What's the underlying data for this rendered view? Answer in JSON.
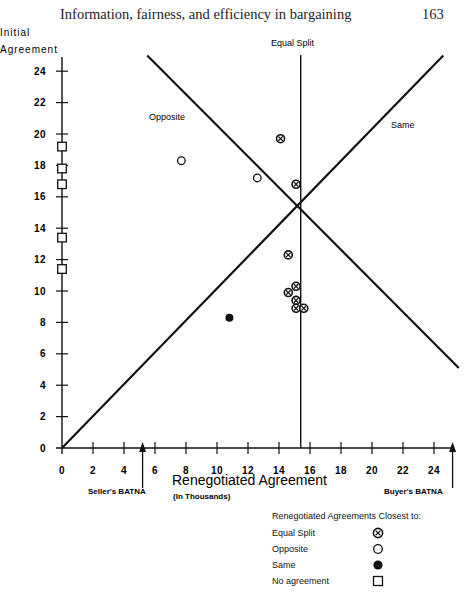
{
  "header": {
    "title": "Information, fairness, and efficiency in bargaining",
    "page_number": "163"
  },
  "chart_data": {
    "type": "scatter",
    "title": "",
    "ylabel_line1": "Initial",
    "ylabel_line2": "Agreement",
    "xlabel": "Renegotiated Agreement",
    "xlabel_sub": "(In Thousands)",
    "xlim": [
      0,
      25
    ],
    "ylim": [
      0,
      25
    ],
    "x_ticks": [
      0,
      2,
      4,
      6,
      8,
      10,
      12,
      14,
      16,
      18,
      20,
      22,
      24
    ],
    "y_ticks": [
      0,
      2,
      4,
      6,
      8,
      10,
      12,
      14,
      16,
      18,
      20,
      22,
      24
    ],
    "grid": false,
    "reference_lines": [
      {
        "name": "Equal Split",
        "type": "vertical",
        "x": 15.4
      },
      {
        "name": "Same",
        "type": "diagonal",
        "from": [
          0,
          0
        ],
        "to": [
          24.6,
          25
        ]
      },
      {
        "name": "Opposite",
        "type": "diagonal",
        "from": [
          5.5,
          25
        ],
        "to": [
          25.6,
          5.1
        ]
      }
    ],
    "annotations": [
      {
        "text": "Seller's BATNA",
        "x": 5.2,
        "arrow": "up"
      },
      {
        "text": "Buyer's BATNA",
        "x": 25.2,
        "arrow": "up"
      }
    ],
    "series": [
      {
        "name": "Equal Split",
        "marker": "circled-x",
        "points": [
          [
            14.1,
            19.7
          ],
          [
            15.1,
            16.8
          ],
          [
            14.6,
            12.3
          ],
          [
            15.1,
            10.3
          ],
          [
            14.6,
            9.9
          ],
          [
            15.1,
            9.4
          ],
          [
            15.1,
            8.9
          ],
          [
            15.6,
            8.9
          ]
        ]
      },
      {
        "name": "Opposite",
        "marker": "open-circle",
        "points": [
          [
            7.7,
            18.3
          ],
          [
            12.6,
            17.2
          ]
        ]
      },
      {
        "name": "Same",
        "marker": "filled-circle",
        "points": [
          [
            10.8,
            8.3
          ]
        ]
      },
      {
        "name": "No agreement",
        "marker": "open-square",
        "points": [
          [
            0,
            19.2
          ],
          [
            0,
            17.8
          ],
          [
            0,
            16.8
          ],
          [
            0,
            13.4
          ],
          [
            0,
            11.4
          ]
        ]
      }
    ],
    "legend": {
      "title": "Renegotiated Agreements Closest to:",
      "position": "bottom-right",
      "entries": [
        "Equal Split",
        "Opposite",
        "Same",
        "No agreement"
      ]
    },
    "line_labels": {
      "equal_split": "Equal Split",
      "opposite": "Opposite",
      "same": "Same"
    },
    "batna": {
      "seller": "Seller's BATNA",
      "buyer": "Buyer's BATNA"
    }
  }
}
